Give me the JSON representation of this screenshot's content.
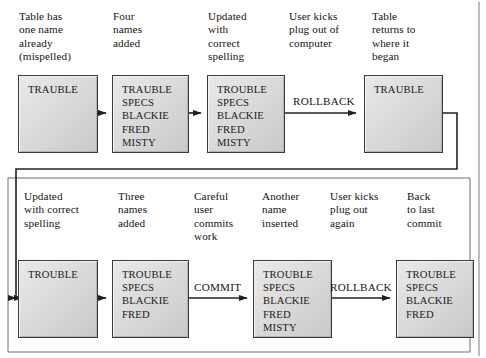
{
  "rows": [
    {
      "id": "top-row",
      "captions": [
        {
          "id": "cap-t1",
          "text": "Table has\none name\nalready\n(mispelled)"
        },
        {
          "id": "cap-t2",
          "text": "Four\nnames\nadded"
        },
        {
          "id": "cap-t3",
          "text": "Updated\nwith\ncorrect\nspelling"
        },
        {
          "id": "cap-t4",
          "text": "User kicks\nplug out of\ncomputer"
        },
        {
          "id": "cap-t5",
          "text": "Table\nreturns to\nwhere it\nbegan"
        }
      ],
      "boxes": [
        {
          "id": "box-t1",
          "rows": [
            "TRAUBLE"
          ]
        },
        {
          "id": "box-t2",
          "rows": [
            "TRAUBLE",
            "SPECS",
            "BLACKIE",
            "FRED",
            "MISTY"
          ]
        },
        {
          "id": "box-t3",
          "rows": [
            "TROUBLE",
            "SPECS",
            "BLACKIE",
            "FRED",
            "MISTY"
          ]
        },
        {
          "id": "box-t4",
          "rows": [
            "TRAUBLE"
          ]
        }
      ],
      "operations": [
        {
          "id": "op-t1",
          "label": "ROLLBACK"
        }
      ]
    },
    {
      "id": "bottom-row",
      "captions": [
        {
          "id": "cap-b1",
          "text": "Updated\nwith correct\nspelling"
        },
        {
          "id": "cap-b2",
          "text": "Three\nnames\nadded"
        },
        {
          "id": "cap-b3",
          "text": "Careful\nuser\ncommits\nwork"
        },
        {
          "id": "cap-b4",
          "text": "Another\nname\ninserted"
        },
        {
          "id": "cap-b5",
          "text": "User kicks\nplug out\nagain"
        },
        {
          "id": "cap-b6",
          "text": "Back\nto last\ncommit"
        }
      ],
      "boxes": [
        {
          "id": "box-b1",
          "rows": [
            "TROUBLE"
          ]
        },
        {
          "id": "box-b2",
          "rows": [
            "TROUBLE",
            "SPECS",
            "BLACKIE",
            "FRED"
          ]
        },
        {
          "id": "box-b3",
          "rows": [
            "TROUBLE",
            "SPECS",
            "BLACKIE",
            "FRED",
            "MISTY"
          ]
        },
        {
          "id": "box-b4",
          "rows": [
            "TROUBLE",
            "SPECS",
            "BLACKIE",
            "FRED"
          ]
        }
      ],
      "operations": [
        {
          "id": "op-b1",
          "label": "COMMIT"
        },
        {
          "id": "op-b2",
          "label": "ROLLBACK"
        }
      ]
    }
  ],
  "colors": {
    "box_border": "#3a3a3a",
    "box_fill_light": "#e9e9e9",
    "box_fill_dark": "#c9c9c9",
    "wire": "#20201f",
    "text": "#141414",
    "page_background": "#ffffff"
  }
}
